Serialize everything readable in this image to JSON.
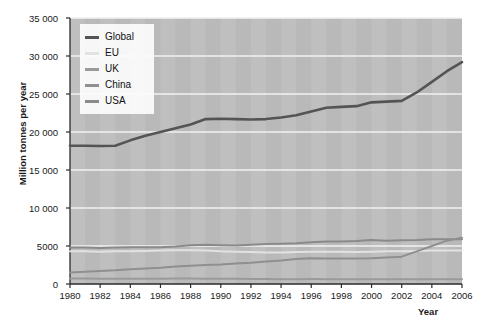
{
  "chart_data": {
    "type": "line",
    "title": "",
    "xlabel": "Year",
    "ylabel": "Million tonnes per year",
    "xlim": [
      1980,
      2006
    ],
    "ylim": [
      0,
      35000
    ],
    "grid": true,
    "legend_position": "top-left",
    "x": [
      1980,
      1981,
      1982,
      1983,
      1984,
      1985,
      1986,
      1987,
      1988,
      1989,
      1990,
      1991,
      1992,
      1993,
      1994,
      1995,
      1996,
      1997,
      1998,
      1999,
      2000,
      2001,
      2002,
      2003,
      2004,
      2005,
      2006
    ],
    "xticks": [
      "1980",
      "1982",
      "1984",
      "1986",
      "1988",
      "1990",
      "1992",
      "1994",
      "1996",
      "1998",
      "2000",
      "2002",
      "2004",
      "2006"
    ],
    "yticks": [
      "0",
      "5000",
      "10 000",
      "15 000",
      "20 000",
      "25 000",
      "30 000",
      "35 000"
    ],
    "ytick_values": [
      0,
      5000,
      10000,
      15000,
      20000,
      25000,
      30000,
      35000
    ],
    "series": [
      {
        "name": "Global",
        "color": "#545454",
        "values": [
          18200,
          18200,
          18150,
          18200,
          18900,
          19500,
          20000,
          20500,
          21000,
          21700,
          21750,
          21700,
          21650,
          21700,
          21900,
          22200,
          22700,
          23200,
          23300,
          23400,
          23900,
          24000,
          24100,
          25200,
          26600,
          28000,
          29200
        ]
      },
      {
        "name": "EU",
        "color": "#e2e2e2",
        "values": [
          4300,
          4300,
          4250,
          4300,
          4300,
          4350,
          4400,
          4450,
          4450,
          4400,
          4300,
          4250,
          4200,
          4150,
          4150,
          4200,
          4250,
          4250,
          4250,
          4200,
          4250,
          4300,
          4300,
          4350,
          4400,
          4400,
          4400
        ]
      },
      {
        "name": "UK",
        "color": "#9a9a9a",
        "values": [
          720,
          710,
          700,
          690,
          680,
          700,
          700,
          710,
          710,
          700,
          690,
          690,
          670,
          650,
          640,
          630,
          650,
          630,
          630,
          620,
          630,
          630,
          620,
          630,
          630,
          620,
          610
        ]
      },
      {
        "name": "China",
        "color": "#8f8f8f",
        "values": [
          1500,
          1600,
          1700,
          1800,
          1950,
          2050,
          2150,
          2300,
          2400,
          2500,
          2550,
          2700,
          2800,
          2950,
          3100,
          3300,
          3400,
          3350,
          3350,
          3350,
          3400,
          3500,
          3600,
          4300,
          5000,
          5700,
          6100
        ]
      },
      {
        "name": "USA",
        "color": "#8a8a8a",
        "values": [
          4800,
          4800,
          4750,
          4800,
          4850,
          4850,
          4850,
          4950,
          5100,
          5150,
          5100,
          5050,
          5150,
          5250,
          5300,
          5350,
          5500,
          5600,
          5600,
          5650,
          5800,
          5700,
          5750,
          5800,
          5900,
          5900,
          5900
        ]
      }
    ]
  },
  "legend": {
    "items": [
      {
        "label": "Global"
      },
      {
        "label": "EU"
      },
      {
        "label": "UK"
      },
      {
        "label": "China"
      },
      {
        "label": "USA"
      }
    ]
  },
  "axes": {
    "x_title": "Year",
    "y_title": "Million tonnes per year"
  }
}
